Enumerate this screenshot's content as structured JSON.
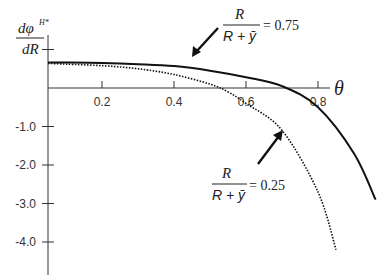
{
  "chart_data": {
    "type": "line",
    "title": "",
    "xlabel": "θ",
    "ylabel": "dφ^{H*}/dR",
    "ylabel_num": "dφ",
    "ylabel_sup": "H*",
    "ylabel_den": "dR",
    "xlim": [
      0,
      1.0
    ],
    "ylim": [
      -4.6,
      1.2
    ],
    "grid": false,
    "x_ticks": [
      "0.2",
      "0.4",
      "0.6",
      "0.8"
    ],
    "y_ticks": [
      "-1.0",
      "-2.0",
      "-3.0",
      "-4.0"
    ],
    "series": [
      {
        "name": "R/(R+ȳ) = 0.75",
        "style": "solid",
        "x": [
          0.0,
          0.1,
          0.2,
          0.3,
          0.4,
          0.5,
          0.6,
          0.7,
          0.8,
          0.9,
          0.96
        ],
        "y": [
          0.66,
          0.66,
          0.65,
          0.62,
          0.57,
          0.45,
          0.28,
          0.05,
          -0.5,
          -1.7,
          -2.9
        ]
      },
      {
        "name": "R/(R+ȳ) = 0.25",
        "style": "dotted",
        "x": [
          0.0,
          0.1,
          0.2,
          0.3,
          0.4,
          0.5,
          0.55,
          0.6,
          0.7,
          0.8,
          0.85
        ],
        "y": [
          0.64,
          0.62,
          0.58,
          0.5,
          0.35,
          0.1,
          -0.1,
          -0.4,
          -1.1,
          -2.7,
          -4.2
        ]
      }
    ],
    "annotations": [
      {
        "text_num": "R",
        "text_den": "R + ȳ",
        "text_eq": "= 0.75",
        "points_to": "solid curve"
      },
      {
        "text_num": "R",
        "text_den": "R + ȳ",
        "text_eq": "= 0.25",
        "points_to": "dotted curve"
      }
    ]
  }
}
